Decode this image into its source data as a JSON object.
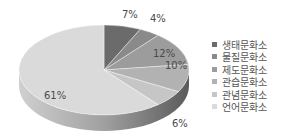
{
  "chart_data": {
    "type": "pie",
    "style": "3d-exploded-none",
    "categories": [
      "생태문화소",
      "물질문화소",
      "제도문화소",
      "관습문화소",
      "관념문화소",
      "언어문화소"
    ],
    "values": [
      7,
      4,
      12,
      10,
      6,
      61
    ],
    "labels": [
      "7%",
      "4%",
      "12%",
      "10%",
      "6%",
      "61%"
    ],
    "colors": [
      "#6b6b6b",
      "#8a8a8a",
      "#9c9c9c",
      "#b2b2b2",
      "#c6c6c6",
      "#dadada"
    ],
    "title": "",
    "legend_position": "right"
  },
  "legend": {
    "items": [
      {
        "label": "생태문화소",
        "color": "#6b6b6b"
      },
      {
        "label": "물질문화소",
        "color": "#8a8a8a"
      },
      {
        "label": "제도문화소",
        "color": "#9c9c9c"
      },
      {
        "label": "관습문화소",
        "color": "#b2b2b2"
      },
      {
        "label": "관념문화소",
        "color": "#c6c6c6"
      },
      {
        "label": "언어문화소",
        "color": "#dadada"
      }
    ]
  },
  "slice_labels": {
    "s0": "7%",
    "s1": "4%",
    "s2": "12%",
    "s3": "10%",
    "s4": "6%",
    "s5": "61%"
  }
}
